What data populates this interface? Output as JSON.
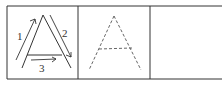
{
  "worksheet": {
    "letter": "A",
    "boxes": [
      {
        "type": "stroke-order-demo",
        "strokes": [
          {
            "number": "1",
            "direction": "up-left diagonal"
          },
          {
            "number": "2",
            "direction": "down-right diagonal"
          },
          {
            "number": "3",
            "direction": "horizontal crossbar"
          }
        ]
      },
      {
        "type": "trace-dashed"
      },
      {
        "type": "empty-practice"
      }
    ],
    "stroke_labels": [
      "1",
      "2",
      "3"
    ],
    "ink_color": "#333333"
  }
}
